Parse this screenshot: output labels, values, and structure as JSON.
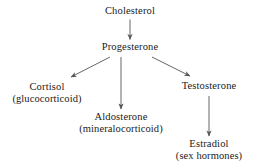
{
  "diagram": {
    "background_color": "#ffffff",
    "text_color": "#1a1a1a",
    "arrow_color": "#55555a",
    "nodes": [
      {
        "id": "cholesterol",
        "name": "Cholesterol",
        "subtitle": ""
      },
      {
        "id": "progesterone",
        "name": "Progesterone",
        "subtitle": ""
      },
      {
        "id": "cortisol",
        "name": "Cortisol",
        "subtitle": "(glucocorticoid)"
      },
      {
        "id": "aldosterone",
        "name": "Aldosterone",
        "subtitle": "(mineralocorticoid)"
      },
      {
        "id": "testosterone",
        "name": "Testosterone",
        "subtitle": ""
      },
      {
        "id": "estradiol",
        "name": "Estradiol",
        "subtitle": "(sex hormones)"
      }
    ],
    "edges": [
      {
        "id": "cholesterol-to-progesterone",
        "from": "cholesterol",
        "to": "progesterone",
        "shape": "vertical"
      },
      {
        "id": "progesterone-to-cortisol",
        "from": "progesterone",
        "to": "cortisol",
        "shape": "diagonal-left"
      },
      {
        "id": "progesterone-to-aldosterone",
        "from": "progesterone",
        "to": "aldosterone",
        "shape": "vertical"
      },
      {
        "id": "progesterone-to-testosterone",
        "from": "progesterone",
        "to": "testosterone",
        "shape": "diagonal-right"
      },
      {
        "id": "testosterone-to-estradiol",
        "from": "testosterone",
        "to": "estradiol",
        "shape": "vertical"
      }
    ]
  }
}
